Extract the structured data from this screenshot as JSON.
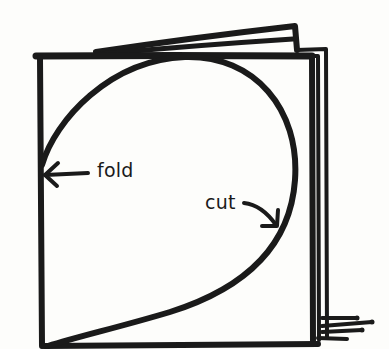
{
  "diagram": {
    "labels": {
      "fold": "fold",
      "cut": "cut"
    },
    "colors": {
      "ink": "#1a1a1a",
      "paper": "#fdfdfb"
    }
  }
}
